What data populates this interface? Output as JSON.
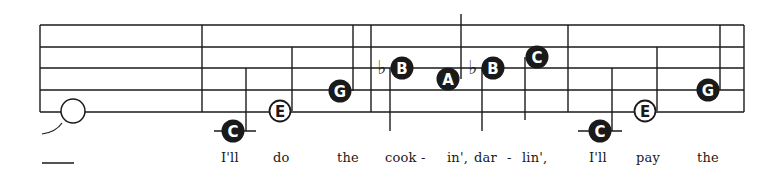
{
  "colors": {
    "ink": "#1a1a1a",
    "paper": "#ffffff"
  },
  "staff": {
    "left_x": 40,
    "right_x": 744,
    "line_y": [
      25,
      47,
      68,
      90,
      112
    ],
    "barlines_x": [
      40,
      202,
      371,
      568,
      744
    ]
  },
  "notes": [
    {
      "id": "n1",
      "letter": "",
      "filled": false,
      "cx": 73,
      "cy": 111,
      "stem": null,
      "ledger": null,
      "flat": false,
      "kind": "whole"
    },
    {
      "id": "n2",
      "letter": "C",
      "filled": true,
      "cx": 233,
      "cy": 131,
      "stem": {
        "x": 246,
        "y1": 68,
        "y2": 131
      },
      "ledger": [
        214,
        256
      ],
      "flat": false
    },
    {
      "id": "n3",
      "letter": "E",
      "filled": false,
      "cx": 280,
      "cy": 111,
      "stem": {
        "x": 292,
        "y1": 47,
        "y2": 111
      },
      "ledger": null,
      "flat": false
    },
    {
      "id": "n4",
      "letter": "G",
      "filled": true,
      "cx": 340,
      "cy": 91,
      "stem": {
        "x": 353,
        "y1": 25,
        "y2": 91
      },
      "ledger": null,
      "flat": false
    },
    {
      "id": "n5",
      "letter": "B",
      "filled": true,
      "cx": 402,
      "cy": 68,
      "stem": {
        "x": 390,
        "y1": 68,
        "y2": 131
      },
      "ledger": null,
      "flat": true,
      "flat_x": 382
    },
    {
      "id": "n6",
      "letter": "A",
      "filled": true,
      "cx": 448,
      "cy": 79,
      "stem": {
        "x": 461,
        "y1": 14,
        "y2": 79
      },
      "ledger": null,
      "flat": false
    },
    {
      "id": "n7",
      "letter": "B",
      "filled": true,
      "cx": 493,
      "cy": 68,
      "stem": {
        "x": 482,
        "y1": 68,
        "y2": 131
      },
      "ledger": null,
      "flat": true,
      "flat_x": 473
    },
    {
      "id": "n8",
      "letter": "C",
      "filled": true,
      "cx": 537,
      "cy": 57,
      "stem": {
        "x": 525,
        "y1": 57,
        "y2": 120
      },
      "ledger": null,
      "flat": false
    },
    {
      "id": "n9",
      "letter": "C",
      "filled": true,
      "cx": 600,
      "cy": 131,
      "stem": {
        "x": 612,
        "y1": 68,
        "y2": 131
      },
      "ledger": [
        578,
        622
      ],
      "flat": false
    },
    {
      "id": "n10",
      "letter": "E",
      "filled": false,
      "cx": 645,
      "cy": 111,
      "stem": {
        "x": 657,
        "y1": 47,
        "y2": 111
      },
      "ledger": null,
      "flat": false
    },
    {
      "id": "n11",
      "letter": "G",
      "filled": true,
      "cx": 708,
      "cy": 90,
      "stem": {
        "x": 720,
        "y1": 25,
        "y2": 90
      },
      "ledger": null,
      "flat": false
    }
  ],
  "flat_symbol": "♭",
  "tie": {
    "from": [
      42,
      134
    ],
    "to": [
      62,
      123
    ]
  },
  "extender_line": {
    "x1": 42,
    "x2": 74,
    "y": 163
  },
  "lyrics": [
    {
      "text": "I'll",
      "x": 221
    },
    {
      "text": "do",
      "x": 273
    },
    {
      "text": "the",
      "x": 337
    },
    {
      "text": "cook -",
      "x": 385
    },
    {
      "text": "in',",
      "x": 447
    },
    {
      "text": "dar",
      "x": 474
    },
    {
      "text": "-",
      "x": 507
    },
    {
      "text": "lin',",
      "x": 522
    },
    {
      "text": "I'll",
      "x": 589
    },
    {
      "text": "pay",
      "x": 636
    },
    {
      "text": "the",
      "x": 697
    }
  ]
}
